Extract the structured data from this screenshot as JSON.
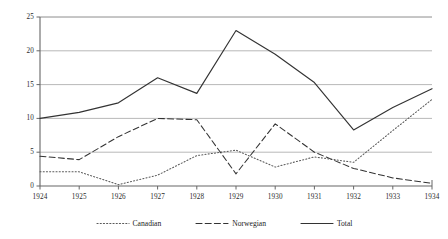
{
  "chart_data": {
    "type": "line",
    "title": "",
    "subtitle": "",
    "xlabel": "",
    "ylabel": "",
    "categories": [
      "1924",
      "1925",
      "1926",
      "1927",
      "1928",
      "1929",
      "1930",
      "1931",
      "1932",
      "1933",
      "1934"
    ],
    "x": [
      1924,
      1925,
      1926,
      1927,
      1928,
      1929,
      1930,
      1931,
      1932,
      1933,
      1934
    ],
    "xlim": [
      1924,
      1934
    ],
    "ylim": [
      0,
      25
    ],
    "yticks": [
      0,
      5,
      10,
      15,
      20,
      25
    ],
    "ytick_labels": [
      "0",
      "5",
      "10",
      "15",
      "20",
      "25"
    ],
    "xtick_labels": [
      "1924",
      "1925",
      "1926",
      "1927",
      "1928",
      "1929",
      "1930",
      "1931",
      "1932",
      "1933",
      "1934"
    ],
    "grid": "horizontal",
    "legend_position": "bottom",
    "series": [
      {
        "name": "Canadian",
        "style": "dotted",
        "color": "#595959",
        "values": [
          2.1,
          2.1,
          0.2,
          1.6,
          4.5,
          5.3,
          2.8,
          4.3,
          3.5,
          8.2,
          12.8
        ]
      },
      {
        "name": "Norwegian",
        "style": "dashed",
        "color": "#333333",
        "values": [
          4.4,
          3.9,
          7.3,
          10.0,
          9.8,
          1.8,
          9.2,
          5.0,
          2.6,
          1.2,
          0.4
        ]
      },
      {
        "name": "Total",
        "style": "solid",
        "color": "#333333",
        "values": [
          10.0,
          10.9,
          12.3,
          16.0,
          13.7,
          23.0,
          19.5,
          15.3,
          8.3,
          11.6,
          14.4
        ]
      }
    ]
  },
  "legend": {
    "items": [
      {
        "label": "Canadian",
        "style": "dotted"
      },
      {
        "label": "Norwegian",
        "style": "dashed"
      },
      {
        "label": "Total",
        "style": "solid"
      }
    ]
  },
  "colors": {
    "gridline": "#a6a6a6",
    "axis": "#808080",
    "line_dark": "#333333",
    "line_gray": "#595959",
    "text": "#2b2b2b",
    "background": "#ffffff"
  },
  "geometry": {
    "plot_left": 40,
    "plot_right": 432,
    "plot_top": 17,
    "plot_bottom": 186
  }
}
